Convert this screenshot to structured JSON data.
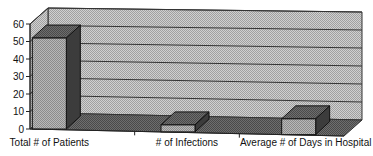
{
  "chart_data": {
    "type": "bar",
    "style": "3d-column",
    "title": "",
    "xlabel": "",
    "ylabel": "",
    "categories": [
      "Total # of Patients",
      "# of Infections",
      "Average # of Days in Hospital"
    ],
    "values": [
      52,
      4,
      9
    ],
    "ylim": [
      0,
      60
    ],
    "yticks": [
      "0",
      "10",
      "20",
      "30",
      "40",
      "50",
      "60"
    ],
    "grid": true,
    "legend": null
  },
  "colors": {
    "wall": "#c8c8c8",
    "floor": "#6a6a6a",
    "bar_front": "#a8a8a8",
    "bar_top": "#5a5a5a",
    "bar_side": "#3c3c3c",
    "grid": "#333333"
  }
}
